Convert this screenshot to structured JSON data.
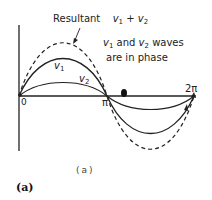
{
  "diagram": {
    "title_label": "Resultant",
    "title_formula": {
      "v1": "v",
      "v1_sub": "1",
      "plus": "+",
      "v2": "v",
      "v2_sub": "2"
    },
    "note_line1": {
      "a": "v",
      "a_sub": "1",
      "mid": " and ",
      "b": "v",
      "b_sub": "2",
      "end": " waves"
    },
    "note_line2": "are in phase",
    "curve_labels": {
      "v1": {
        "v": "v",
        "sub": "1"
      },
      "v2": {
        "v": "v",
        "sub": "2"
      }
    },
    "axis_ticks": {
      "origin": "0",
      "pi": "π",
      "two_pi": "2π"
    },
    "sub_caption": "(a)",
    "figure_caption": "(a)",
    "curves": [
      {
        "name": "v1",
        "style": "solid",
        "amplitude_px": 38
      },
      {
        "name": "v2",
        "style": "solid",
        "amplitude_px": 14
      },
      {
        "name": "resultant",
        "style": "dashed",
        "amplitude_px": 53
      }
    ],
    "colors": {
      "ink": "#222222",
      "background": "#ffffff"
    }
  }
}
